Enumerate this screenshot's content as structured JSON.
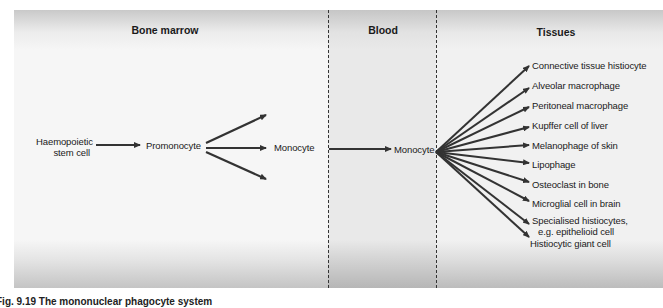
{
  "zones": {
    "bone_marrow": "Bone marrow",
    "blood": "Blood",
    "tissues": "Tissues"
  },
  "nodes": {
    "stem_cell_line1": "Haemopoietic",
    "stem_cell_line2": "stem cell",
    "promonocyte": "Promonocyte",
    "monocyte_marrow": "Monocyte",
    "monocyte_blood": "Monocyte"
  },
  "tissue_cells": [
    "Connective tissue histiocyte",
    "Alveolar macrophage",
    "Peritoneal macrophage",
    "Kupffer cell of liver",
    "Melanophage of skin",
    "Lipophage",
    "Osteoclast in bone",
    "Microglial cell in brain",
    "Specialised histiocytes,",
    "e.g. epithelioid cell",
    "Histiocytic giant cell"
  ],
  "caption": "Fig. 9.19  The mononuclear phagocyte system",
  "colors": {
    "arrow": "#333333",
    "text": "#1a1a1a"
  }
}
